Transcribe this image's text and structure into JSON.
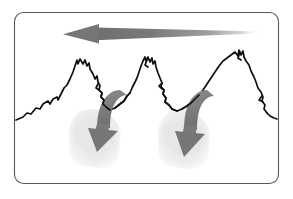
{
  "figure": {
    "title": "Mountain range with prevailing wind and downslope arrows",
    "caption": "",
    "canvas": {
      "width": 293,
      "height": 199,
      "background": "#ffffff"
    },
    "frame": {
      "name": "rounded-rectangle-border",
      "x": 14,
      "y": 12,
      "width": 265,
      "height": 172,
      "radius": 9,
      "stroke": "#585858",
      "stroke_width": 1.1,
      "fill": "#ffffff",
      "label": ""
    },
    "palette": {
      "arrow_gray": "#7d7d7d",
      "arrow_gray_dark": "#6e6e6e",
      "arrow_gray_light": "#b9b9b9",
      "mountain_outline": "#111111",
      "blob_gray": "#ececec",
      "blob_gray_soft": "#f2f2f2",
      "border": "#585858",
      "background": "#ffffff"
    },
    "elements": {
      "wind_arrow": {
        "name": "leftward-wind-arrow",
        "label": "",
        "direction": "left",
        "tip_x": 63,
        "tip_y": 34,
        "tail_x": 259,
        "tail_y": 32,
        "color": "#7d7d7d"
      },
      "mountains": {
        "name": "mountain-range-outline",
        "label": "",
        "peak_count": 3,
        "peak_positions": [
          77,
          146,
          240
        ],
        "color": "#111111"
      },
      "downslope_arrows": [
        {
          "name": "downslope-arrow-left",
          "label": "",
          "start_x": 120,
          "start_y": 91,
          "head_x": 96,
          "head_y": 147,
          "color": "#7d7d7d"
        },
        {
          "name": "downslope-arrow-right",
          "label": "",
          "start_x": 207,
          "start_y": 91,
          "head_x": 183,
          "head_y": 152,
          "color": "#7d7d7d"
        }
      ],
      "blobs": [
        {
          "name": "valley-blob-left",
          "label": "",
          "center_x": 95,
          "center_y": 139,
          "radius_x": 26,
          "radius_y": 30,
          "color": "#ececec"
        },
        {
          "name": "valley-blob-right",
          "label": "",
          "center_x": 184,
          "center_y": 140,
          "radius_x": 25,
          "radius_y": 29,
          "color": "#ececec"
        }
      ]
    }
  }
}
